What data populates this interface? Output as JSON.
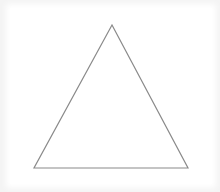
{
  "diagram": {
    "shape": "triangle",
    "type": "equilateral-like",
    "stroke_color": "#8a8a8a",
    "fill_color": "#ffffff",
    "background_color": "#f4f4f4",
    "vertices": {
      "apex": [
        112,
        25
      ],
      "bottom_left": [
        34,
        168
      ],
      "bottom_right": [
        188,
        168
      ]
    }
  }
}
